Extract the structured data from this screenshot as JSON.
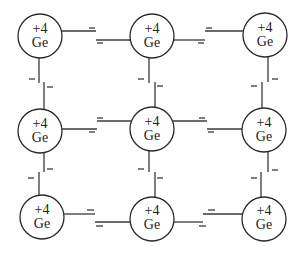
{
  "diagram": {
    "grid": {
      "rows": 3,
      "cols": 3
    },
    "electron_mark": "−",
    "atoms": [
      {
        "charge": "+4",
        "element": "Ge"
      },
      {
        "charge": "+4",
        "element": "Ge"
      },
      {
        "charge": "+4",
        "element": "Ge"
      },
      {
        "charge": "+4",
        "element": "Ge"
      },
      {
        "charge": "+4",
        "element": "Ge"
      },
      {
        "charge": "+4",
        "element": "Ge"
      },
      {
        "charge": "+4",
        "element": "Ge"
      },
      {
        "charge": "+4",
        "element": "Ge"
      },
      {
        "charge": "+4",
        "element": "Ge"
      }
    ],
    "bonds": [
      {
        "from": 0,
        "to": 1,
        "electrons": 2
      },
      {
        "from": 1,
        "to": 2,
        "electrons": 2
      },
      {
        "from": 3,
        "to": 4,
        "electrons": 2
      },
      {
        "from": 4,
        "to": 5,
        "electrons": 2
      },
      {
        "from": 6,
        "to": 7,
        "electrons": 2
      },
      {
        "from": 7,
        "to": 8,
        "electrons": 2
      },
      {
        "from": 0,
        "to": 3,
        "electrons": 2
      },
      {
        "from": 1,
        "to": 4,
        "electrons": 2
      },
      {
        "from": 2,
        "to": 5,
        "electrons": 2
      },
      {
        "from": 3,
        "to": 6,
        "electrons": 2
      },
      {
        "from": 4,
        "to": 7,
        "electrons": 2
      },
      {
        "from": 5,
        "to": 8,
        "electrons": 2
      }
    ]
  }
}
